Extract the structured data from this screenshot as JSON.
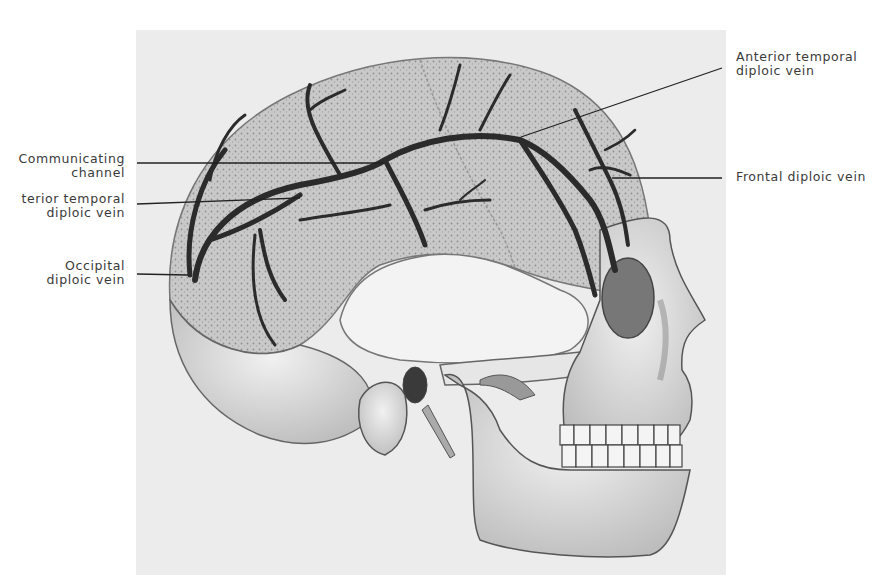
{
  "figure": {
    "labels": [
      {
        "id": "communicating-channel",
        "lines": [
          "Communicating",
          "channel"
        ],
        "side": "left"
      },
      {
        "id": "posterior-temporal-diploic-vein",
        "lines": [
          "terior temporal",
          "diploic vein"
        ],
        "side": "left"
      },
      {
        "id": "occipital-diploic-vein",
        "lines": [
          "Occipital",
          "diploic vein"
        ],
        "side": "left"
      },
      {
        "id": "anterior-temporal-diploic-vein",
        "lines": [
          "Anterior temporal",
          "diploic vein"
        ],
        "side": "right"
      },
      {
        "id": "frontal-diploic-vein",
        "lines": [
          "Frontal diploic vein"
        ],
        "side": "right"
      }
    ]
  },
  "colors": {
    "plate": "#ececec",
    "bone": "#d9d9d9",
    "bone_light": "#eeeeee",
    "vein": "#2b2b2b",
    "label_text": "#3a3a3a",
    "leader": "#222222"
  }
}
